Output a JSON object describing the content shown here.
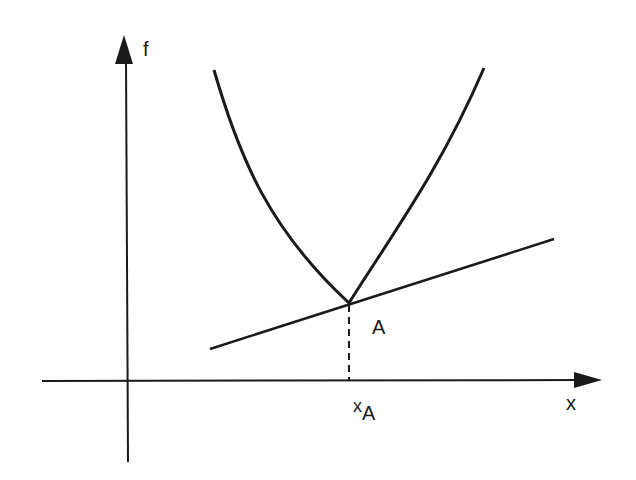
{
  "diagram": {
    "type": "convex-function-subgradient",
    "axes": {
      "y_label": "f",
      "x_label": "x"
    },
    "point": {
      "label": "A",
      "x_label": "x",
      "x_subscript": "A"
    },
    "elements": [
      "convex function with kink at A",
      "supporting line (subgradient) through A",
      "dashed projection from A to x-axis"
    ],
    "colors": {
      "ink": "#1a1a1a",
      "background": "#ffffff"
    }
  }
}
